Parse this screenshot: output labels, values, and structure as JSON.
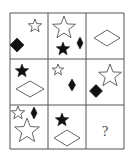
{
  "puzzle": {
    "type": "3x3 visual matrix reasoning puzzle",
    "grid": {
      "x_lines": [
        10,
        48,
        86,
        124
      ],
      "y_lines": [
        13,
        59,
        105,
        149
      ],
      "line_color": "#555555",
      "rows": 3,
      "cols": 3
    },
    "colors": {
      "fill": "#111111",
      "outline": "#555555",
      "background": "#ffffff"
    },
    "cells": [
      {
        "row": 0,
        "col": 0,
        "shapes": [
          {
            "kind": "star",
            "style": "outline",
            "cx": 35,
            "cy": 26,
            "r": 7
          },
          {
            "kind": "diamond",
            "style": "filled",
            "cx": 17,
            "cy": 45,
            "w": 14,
            "h": 14
          }
        ]
      },
      {
        "row": 0,
        "col": 1,
        "shapes": [
          {
            "kind": "star",
            "style": "outline",
            "cx": 64,
            "cy": 28,
            "r": 12
          },
          {
            "kind": "star",
            "style": "filled",
            "cx": 63,
            "cy": 49,
            "r": 7
          },
          {
            "kind": "diamond",
            "style": "filled",
            "cx": 80,
            "cy": 43,
            "w": 6,
            "h": 12
          }
        ]
      },
      {
        "row": 0,
        "col": 2,
        "shapes": [
          {
            "kind": "diamond",
            "style": "outline",
            "cx": 107,
            "cy": 38,
            "w": 26,
            "h": 16
          }
        ]
      },
      {
        "row": 1,
        "col": 0,
        "shapes": [
          {
            "kind": "star",
            "style": "filled",
            "cx": 22,
            "cy": 71,
            "r": 7
          },
          {
            "kind": "diamond",
            "style": "outline",
            "cx": 30,
            "cy": 89,
            "w": 28,
            "h": 16
          }
        ]
      },
      {
        "row": 1,
        "col": 1,
        "shapes": [
          {
            "kind": "star",
            "style": "outline",
            "cx": 58,
            "cy": 70,
            "r": 6
          },
          {
            "kind": "diamond",
            "style": "filled",
            "cx": 72,
            "cy": 85,
            "w": 7,
            "h": 12
          }
        ]
      },
      {
        "row": 1,
        "col": 2,
        "shapes": [
          {
            "kind": "star",
            "style": "outline",
            "cx": 110,
            "cy": 76,
            "r": 12
          },
          {
            "kind": "diamond",
            "style": "filled",
            "cx": 96,
            "cy": 91,
            "w": 13,
            "h": 13
          }
        ]
      },
      {
        "row": 2,
        "col": 0,
        "shapes": [
          {
            "kind": "star",
            "style": "outline",
            "cx": 18,
            "cy": 113,
            "r": 7
          },
          {
            "kind": "diamond",
            "style": "filled",
            "cx": 34,
            "cy": 113,
            "w": 6,
            "h": 12
          },
          {
            "kind": "star",
            "style": "outline",
            "cx": 27,
            "cy": 131,
            "r": 13
          }
        ]
      },
      {
        "row": 2,
        "col": 1,
        "shapes": [
          {
            "kind": "star",
            "style": "filled",
            "cx": 62,
            "cy": 120,
            "r": 7
          },
          {
            "kind": "diamond",
            "style": "outline",
            "cx": 67,
            "cy": 138,
            "w": 26,
            "h": 16
          }
        ]
      },
      {
        "row": 2,
        "col": 2,
        "shapes": [],
        "label": "?"
      }
    ],
    "missing_label": "?"
  }
}
